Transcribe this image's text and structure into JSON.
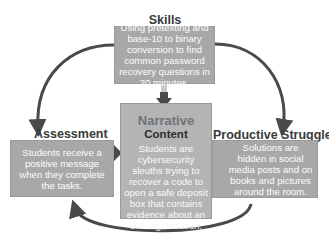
{
  "diagram": {
    "nodes": {
      "skills": {
        "heading": "Skills",
        "text": "Using pretexting and base-10 to binary conversion to find common password recovery questions in 20 minutes."
      },
      "narrative": {
        "heading_line1": "Narrative",
        "heading_line2": "Content",
        "text": "Students are cybersecurity sleuths trying to recover a code to open a safe deposit box that contains evidence about an evil organization."
      },
      "assessment": {
        "heading": "Assessment",
        "text": "Students receive a positive message when they complete the tasks."
      },
      "productive_struggle": {
        "heading": "Productive Struggle",
        "text": "Solutions are hidden in social media posts and on books and pictures around the room."
      }
    },
    "edges": [
      {
        "from": "skills",
        "to": "narrative",
        "style": "straight-arrow"
      },
      {
        "from": "assessment",
        "to": "narrative",
        "style": "straight-arrow"
      },
      {
        "from": "productive_struggle",
        "to": "narrative",
        "style": "straight-arrow"
      },
      {
        "from": "skills",
        "to": "assessment",
        "style": "curved-arrow"
      },
      {
        "from": "skills",
        "to": "productive_struggle",
        "style": "curved-arrow"
      },
      {
        "from": "productive_struggle",
        "to": "assessment",
        "style": "curved-arrow"
      }
    ],
    "colors": {
      "box_fill": "#a8a8a8",
      "center_fill": "#b4b4b4",
      "arrow": "#4a4a4a",
      "heading": "#3a3a3a"
    }
  }
}
